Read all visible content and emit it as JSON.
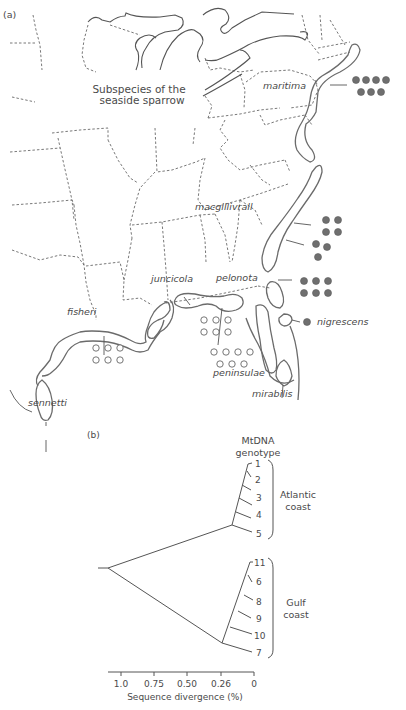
{
  "figure": {
    "panel_a": {
      "label": "(a)",
      "title_line1": "Subspecies of the",
      "title_line2": "seaside sparrow",
      "subspecies": [
        {
          "name": "maritima",
          "marker": "filled",
          "count": 7
        },
        {
          "name": "macgillivraii",
          "marker": "filled",
          "count": 7
        },
        {
          "name": "pelonota",
          "marker": "filled",
          "count": 6
        },
        {
          "name": "nigrescens",
          "marker": "filled",
          "count": 1
        },
        {
          "name": "juncicola",
          "marker": "open",
          "count": 6
        },
        {
          "name": "fisheri",
          "marker": "open",
          "count": 6
        },
        {
          "name": "peninsulae",
          "marker": "open",
          "count": 7
        },
        {
          "name": "mirabilis",
          "marker": "none",
          "count": 0
        },
        {
          "name": "sennetti",
          "marker": "none",
          "count": 0
        }
      ],
      "labels": {
        "maritima": "maritima",
        "macgillivraii": "macgillivrall",
        "pelonota": "pelonota",
        "nigrescens": "nigrescens",
        "juncicola": "juncicola",
        "fisheri": "fisheri",
        "peninsulae": "peninsulae",
        "mirabilis": "mirabilis",
        "sennetti": "sennetti"
      },
      "colors": {
        "filled_marker": "#6f6f6f",
        "open_marker": "#ffffff",
        "outline": "#6b6b6b"
      }
    },
    "panel_b": {
      "label": "(b)",
      "header_line1": "MtDNA",
      "header_line2": "genotype",
      "atlantic_label_line1": "Atlantic",
      "atlantic_label_line2": "coast",
      "gulf_label_line1": "Gulf",
      "gulf_label_line2": "coast",
      "atlantic_tips": [
        "1",
        "2",
        "3",
        "4",
        "5"
      ],
      "gulf_tips": [
        "11",
        "6",
        "8",
        "9",
        "10",
        "7"
      ],
      "axis": {
        "ticks": [
          "1.0",
          "0.75",
          "0.50",
          "0.26",
          "0"
        ],
        "label": "Sequence divergence (%)"
      }
    }
  }
}
